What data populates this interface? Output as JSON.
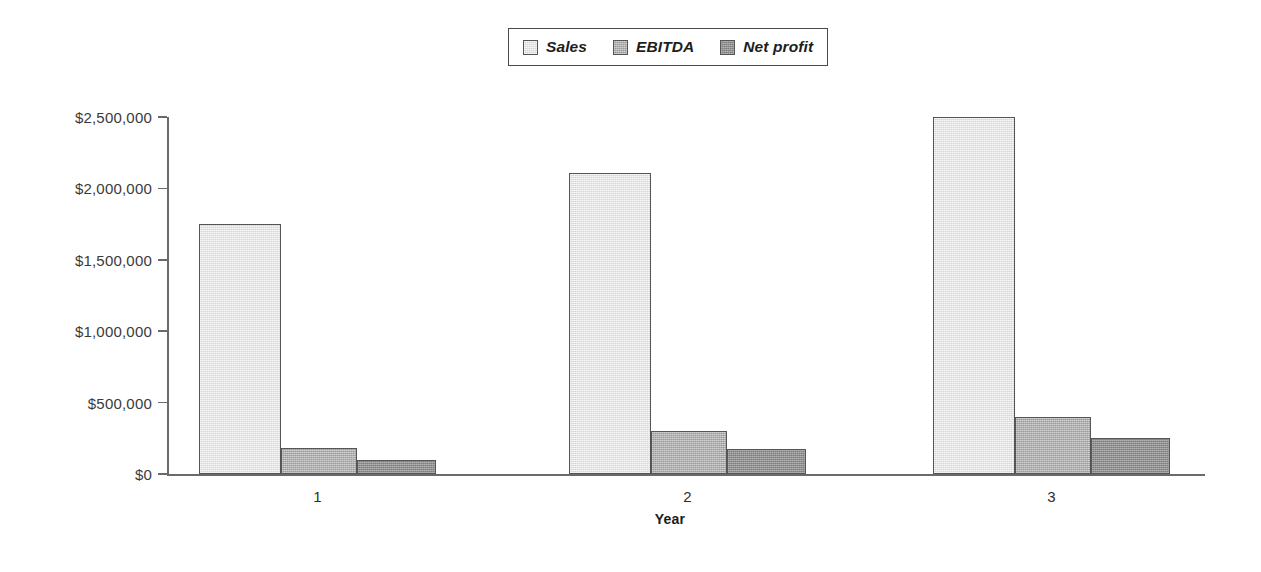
{
  "chart_data": {
    "type": "bar",
    "title": "",
    "subtitle": "",
    "xlabel": "Year",
    "ylabel": "",
    "categories": [
      "1",
      "2",
      "3"
    ],
    "series": [
      {
        "name": "Sales",
        "values": [
          1750000,
          2110000,
          2500000
        ],
        "color": "#dedede"
      },
      {
        "name": "EBITDA",
        "values": [
          185000,
          300000,
          400000
        ],
        "color": "#a9a9a9"
      },
      {
        "name": "Net profit",
        "values": [
          100000,
          175000,
          250000
        ],
        "color": "#8d8d8d"
      }
    ],
    "ylim": [
      0,
      2500000
    ],
    "yticks": [
      0,
      500000,
      1000000,
      1500000,
      2000000,
      2500000
    ],
    "ytick_labels": [
      "$0",
      "$500,000",
      "$1,000,000",
      "$1,500,000",
      "$2,000,000",
      "$2,500,000"
    ],
    "grid": false,
    "legend_position": "top-center",
    "axis_color": "#6a6a6a",
    "bar_border_color": "#55555a",
    "background_color": "#ffffff"
  },
  "legend": {
    "entries": [
      {
        "label": "Sales"
      },
      {
        "label": "EBITDA"
      },
      {
        "label": "Net profit"
      }
    ]
  },
  "axes": {
    "x_title": "Year",
    "category_labels": [
      "1",
      "2",
      "3"
    ],
    "y_labels": [
      "$2,500,000",
      "$2,000,000",
      "$1,500,000",
      "$1,000,000",
      "$500,000",
      "$0"
    ]
  }
}
